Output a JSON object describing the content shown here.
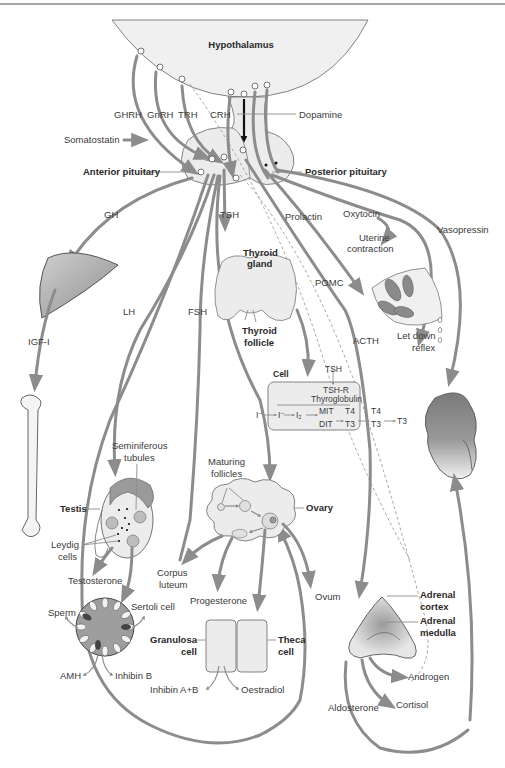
{
  "diagram": {
    "colors": {
      "arrow": "#8c8c8c",
      "organ_fill": "#e4e4e4",
      "organ_dark": "#8a8a8a",
      "line": "#555555",
      "background": "#ffffff"
    },
    "hypothalamus": {
      "label": "Hypothalamus"
    },
    "releasing_hormones": {
      "ghrh": "GHRH",
      "gnrh": "GnRH",
      "trh": "TRH",
      "crh": "CRH",
      "dopamine": "Dopamine",
      "somatostatin": "Somatostatin"
    },
    "pituitary": {
      "anterior": "Anterior pituitary",
      "posterior": "Posterior pituitary"
    },
    "pituitary_hormones": {
      "gh": "GH",
      "tsh": "TSH",
      "prolactin": "Prolactin",
      "oxytocin": "Oxytocin",
      "vasopressin": "Vasopressin",
      "lh": "LH",
      "fsh": "FSH",
      "pomc": "POMC",
      "acth": "ACTH"
    },
    "liver_bone": {
      "igf": "IGF-I"
    },
    "thyroid": {
      "gland_l1": "Thyroid",
      "gland_l2": "gland",
      "follicle_l1": "Thyroid",
      "follicle_l2": "follicle"
    },
    "thyroid_cell": {
      "cell": "Cell",
      "tsh": "TSH",
      "tshr": "TSH-R",
      "thyroglobulin": "Thyroglobulin",
      "iodide_out": "I⁻",
      "iodide_in": "I⁻",
      "iodine": "I₂",
      "mit": "MIT",
      "dit": "DIT",
      "t4_in": "T4",
      "t3_in": "T3",
      "t4_out": "T4",
      "t3_out": "T3",
      "t3_final": "T3"
    },
    "breast": {
      "uterine_l1": "Uterine",
      "uterine_l2": "contraction",
      "letdown_l1": "Let down",
      "letdown_l2": "reflex"
    },
    "testis": {
      "label": "Testis",
      "seminiferous_l1": "Seminiferous",
      "seminiferous_l2": "tubules",
      "leydig_l1": "Leydig",
      "leydig_l2": "cells",
      "testosterone": "Testosterone",
      "sperm": "Sperm",
      "sertoli": "Sertoli cell",
      "amh": "AMH",
      "inhibin_b": "Inhibin B"
    },
    "ovary": {
      "label": "Ovary",
      "maturing_l1": "Maturing",
      "maturing_l2": "follicles",
      "corpus_l1": "Corpus",
      "corpus_l2": "luteum",
      "progesterone": "Progesterone",
      "ovum": "Ovum",
      "granulosa_l1": "Granulosa",
      "granulosa_l2": "cell",
      "theca_l1": "Theca",
      "theca_l2": "cell",
      "inhibin_ab": "Inhibin A+B",
      "oestradiol": "Oestradiol"
    },
    "adrenal": {
      "cortex_l1": "Adrenal",
      "cortex_l2": "cortex",
      "medulla_l1": "Adrenal",
      "medulla_l2": "medulla",
      "androgen": "Androgen",
      "cortisol": "Cortisol",
      "aldosterone": "Aldosterone"
    }
  }
}
